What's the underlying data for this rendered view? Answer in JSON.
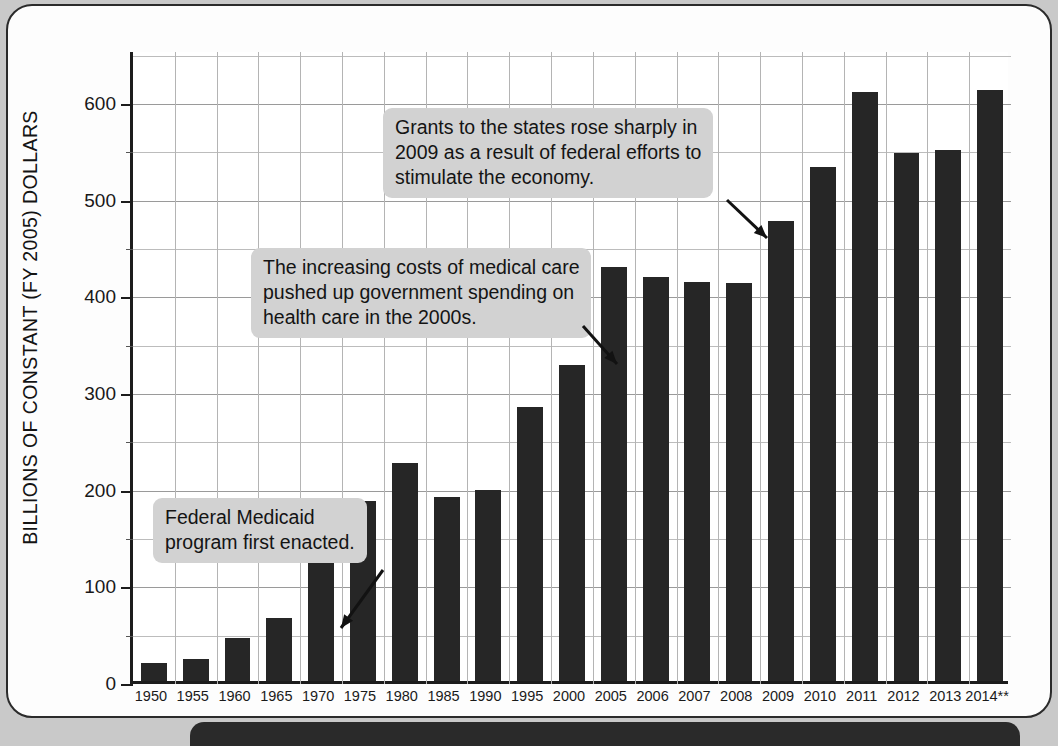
{
  "chart_data": {
    "type": "bar",
    "title": "",
    "xlabel": "",
    "ylabel": "BILLIONS OF CONSTANT (FY 2005) DOLLARS",
    "ylim": [
      0,
      650
    ],
    "ytick_labels": [
      "0",
      "100",
      "200",
      "300",
      "400",
      "500",
      "600"
    ],
    "ytick_values": [
      0,
      100,
      200,
      300,
      400,
      500,
      600
    ],
    "grid": true,
    "legend": "none",
    "bar_color": "#262626",
    "categories": [
      "1950",
      "1955",
      "1960",
      "1965",
      "1970",
      "1975",
      "1980",
      "1985",
      "1990",
      "1995",
      "2000",
      "2005",
      "2006",
      "2007",
      "2008",
      "2009",
      "2010",
      "2011",
      "2012",
      "2013",
      "2014**"
    ],
    "values": [
      19,
      23,
      44,
      65,
      122,
      186,
      226,
      190,
      198,
      283,
      327,
      428,
      418,
      413,
      412,
      476,
      532,
      609,
      546,
      549,
      611
    ],
    "annotations": [
      {
        "id": "medicaid",
        "lines": [
          "Federal Medicaid",
          "program first enacted."
        ],
        "points_to_category": "1965"
      },
      {
        "id": "medical-costs",
        "lines": [
          "The increasing costs of medical care",
          "pushed up government spending on",
          "health care in the 2000s."
        ],
        "points_to_category": "2005"
      },
      {
        "id": "stimulus",
        "lines": [
          "Grants to the states rose sharply in",
          "2009 as a result of federal efforts to",
          "stimulate the economy."
        ],
        "points_to_category": "2009"
      }
    ]
  },
  "colors": {
    "bar": "#262626",
    "callout_background": "#d2d2d2",
    "page_background": "#fdfdfd",
    "axis": "#1c1c1c",
    "outer_background": "#c9c9c9"
  }
}
